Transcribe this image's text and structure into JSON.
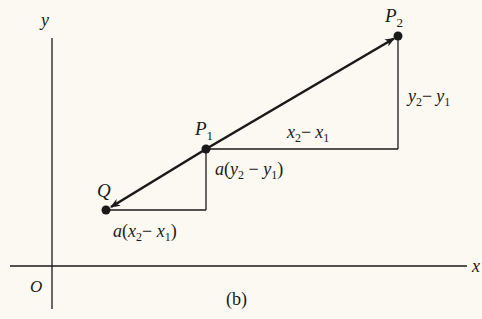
{
  "figure": {
    "caption": "(b)",
    "background": "#fbf9f1",
    "ink": "#1a1a1a"
  },
  "axes": {
    "x_label": "x",
    "y_label": "y",
    "origin_label": "O"
  },
  "points": {
    "P2": {
      "main": "P",
      "sub": "2"
    },
    "P1": {
      "main": "P",
      "sub": "1"
    },
    "Q": {
      "main": "Q"
    }
  },
  "labels": {
    "dy_big": {
      "a": "y",
      "a_sub": "2",
      "op": "−",
      "b": "y",
      "b_sub": "1"
    },
    "dx_big": {
      "a": "x",
      "a_sub": "2",
      "op": "−",
      "b": "x",
      "b_sub": "1"
    },
    "dy_small": {
      "coef": "a",
      "open": "(",
      "a": "y",
      "a_sub": "2",
      "op": " − ",
      "b": "y",
      "b_sub": "1",
      "close": ")"
    },
    "dx_small": {
      "coef": "a",
      "open": "(",
      "a": "x",
      "a_sub": "2",
      "op": "− ",
      "b": "x",
      "b_sub": "1",
      "close": ")"
    }
  }
}
